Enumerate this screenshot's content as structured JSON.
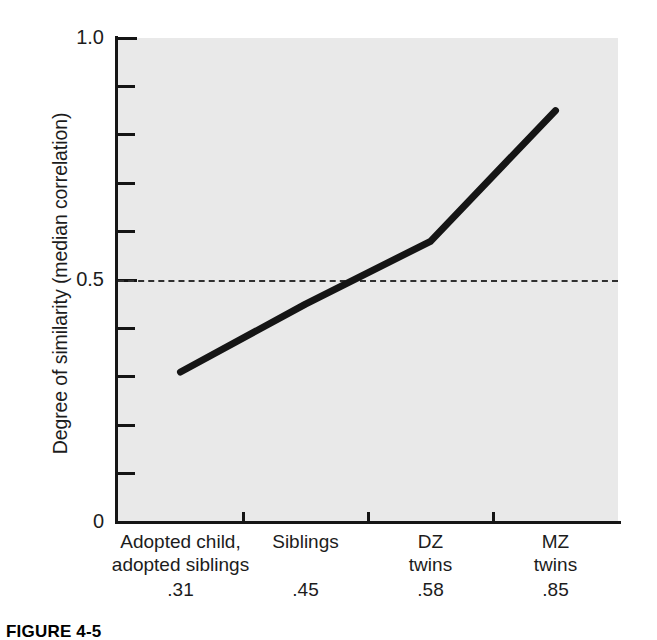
{
  "chart_data": {
    "type": "line",
    "title": "",
    "xlabel": "",
    "ylabel": "Degree of similarity (median correlation)",
    "categories": [
      "Adopted child, adopted siblings",
      "Siblings",
      "DZ twins",
      "MZ twins"
    ],
    "category_lines": [
      [
        "Adopted child,",
        "adopted siblings"
      ],
      [
        "Siblings",
        ""
      ],
      [
        "DZ",
        "twins"
      ],
      [
        "MZ",
        "twins"
      ]
    ],
    "values": [
      0.31,
      0.45,
      0.58,
      0.85
    ],
    "value_labels": [
      ".31",
      ".45",
      ".58",
      ".85"
    ],
    "ylim": [
      0,
      1.0
    ],
    "y_major_ticks": [
      0,
      0.5,
      1.0
    ],
    "y_major_tick_labels": [
      "0",
      "0.5",
      "1.0"
    ],
    "y_minor_ticks": [
      0.1,
      0.2,
      0.3,
      0.4,
      0.6,
      0.7,
      0.8,
      0.9
    ],
    "reference_line": {
      "value": 0.5,
      "style": "dashed",
      "color": "#303030"
    },
    "grid": false,
    "legend": null,
    "line_color": "#151515",
    "plot_background": "#e9e9e9",
    "figure_background": "#ffffff"
  },
  "caption": {
    "label": "FIGURE 4-5"
  }
}
